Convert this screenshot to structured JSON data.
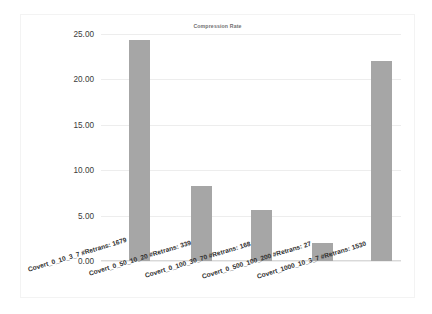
{
  "chart_data": {
    "type": "bar",
    "title": "Compression Rate",
    "xlabel": "",
    "ylabel": "",
    "ylim": [
      0,
      25
    ],
    "grid": true,
    "legend": "none",
    "categories": [
      "Covert_0_10_3_7 #Retrans: 1679",
      "Covert_0_50_10_20 #Retrans: 339",
      "Covert_0_100_30_70 #Retrans: 168",
      "Covert_0_500_100_200 #Retrans: 27",
      "Covert_1000_10_3_7 #Retrans: 1530"
    ],
    "values": [
      24.35,
      8.25,
      5.6,
      2.0,
      22.0
    ],
    "ytick_labels": [
      "0.00",
      "5.00",
      "10.00",
      "15.00",
      "20.00",
      "25.00"
    ],
    "ytick_values": [
      0,
      5,
      10,
      15,
      20,
      25
    ],
    "bar_color": "#a6a6a6",
    "grid_color": "#ededed",
    "background_color": "#ffffff",
    "title_color": "#6f6f6f"
  }
}
